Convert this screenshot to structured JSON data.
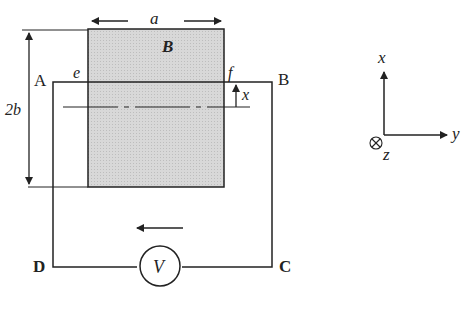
{
  "figure": {
    "labels": {
      "width": "a",
      "height": "2b",
      "field": "B",
      "corner_e": "e",
      "corner_f": "f",
      "point_A": "A",
      "point_B": "B",
      "point_C": "C",
      "point_D": "D",
      "displacement": "x",
      "voltmeter": "V"
    },
    "axes": {
      "x": "x",
      "y": "y",
      "z": "z"
    },
    "colors": {
      "field_region": "#d6d6d6",
      "line": "#222222"
    }
  }
}
